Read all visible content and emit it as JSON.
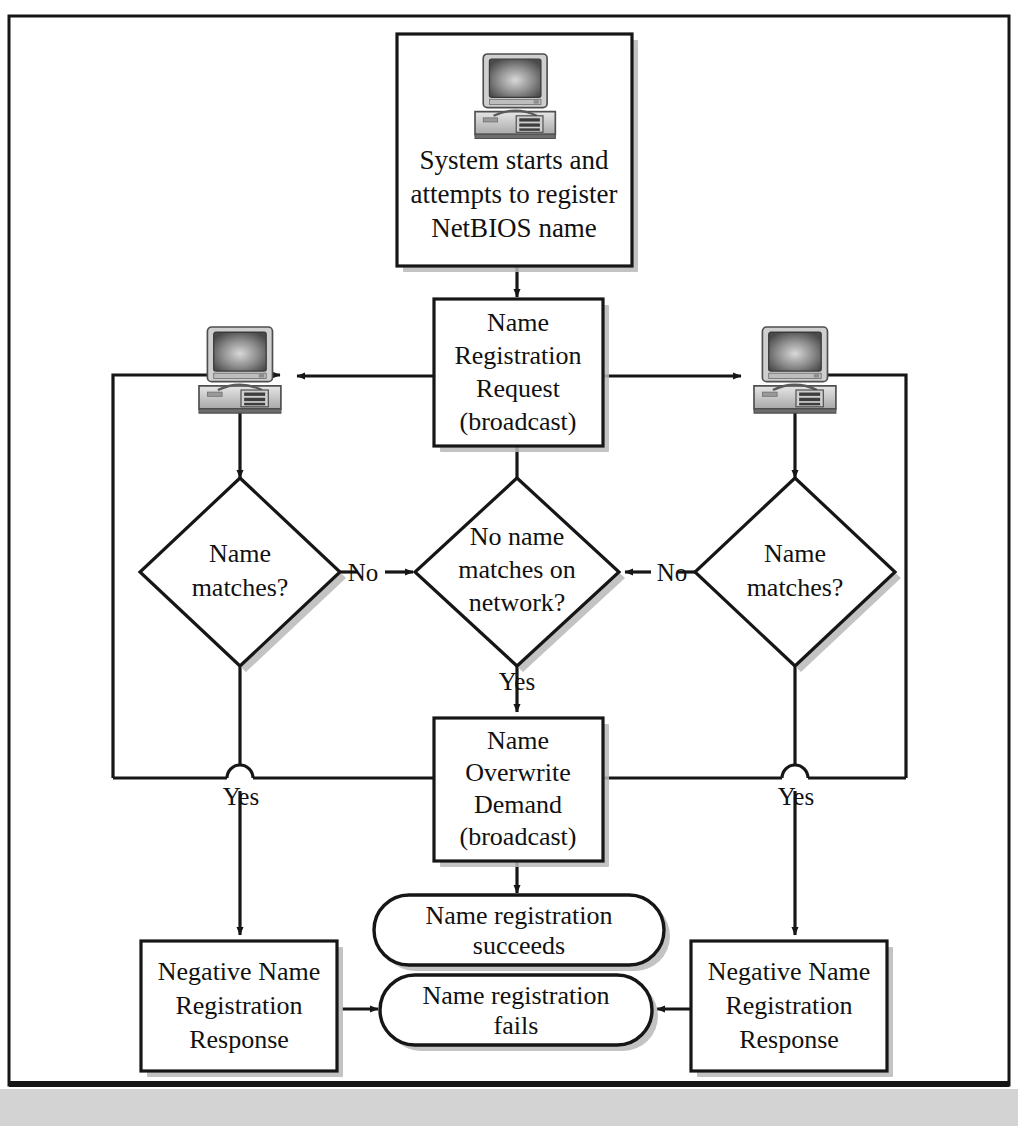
{
  "figure": {
    "background_color": "#ffffff",
    "frame_border_color": "#161616",
    "footer_bar_color": "#d3d3d3",
    "shape_fill": "#ffffff",
    "shape_stroke": "#161616",
    "shadow_color": "#b9b9b9"
  },
  "nodes": {
    "start": {
      "shape": "process",
      "icon": "desktop-computer-icon",
      "lines": [
        "System starts and",
        "attempts to register",
        "NetBIOS name"
      ]
    },
    "name_registration_request": {
      "shape": "process",
      "lines": [
        "Name",
        "Registration",
        "Request",
        "(broadcast)"
      ]
    },
    "left_host": {
      "shape": "icon",
      "icon": "desktop-computer-icon"
    },
    "right_host": {
      "shape": "icon",
      "icon": "desktop-computer-icon"
    },
    "left_decision": {
      "shape": "decision",
      "lines": [
        "Name",
        "matches?"
      ]
    },
    "center_decision": {
      "shape": "decision",
      "lines": [
        "No name",
        "matches on",
        "network?"
      ]
    },
    "right_decision": {
      "shape": "decision",
      "lines": [
        "Name",
        "matches?"
      ]
    },
    "name_overwrite_demand": {
      "shape": "process",
      "lines": [
        "Name",
        "Overwrite",
        "Demand",
        "(broadcast)"
      ]
    },
    "succeeds": {
      "shape": "terminator",
      "lines": [
        "Name registration",
        "succeeds"
      ]
    },
    "fails": {
      "shape": "terminator",
      "lines": [
        "Name registration",
        "fails"
      ]
    },
    "left_negative_response": {
      "shape": "process",
      "lines": [
        "Negative Name",
        "Registration",
        "Response"
      ]
    },
    "right_negative_response": {
      "shape": "process",
      "lines": [
        "Negative Name",
        "Registration",
        "Response"
      ]
    }
  },
  "edge_labels": {
    "left_no": "No",
    "right_no": "No",
    "center_yes": "Yes",
    "left_yes": "Yes",
    "right_yes": "Yes"
  }
}
